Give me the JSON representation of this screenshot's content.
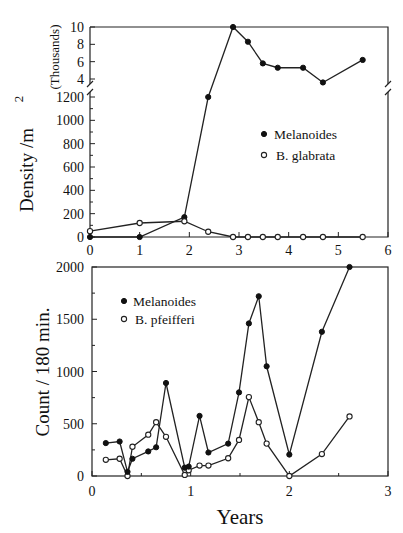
{
  "figure": {
    "title_partial": "",
    "shared_y_label": "Density /m",
    "shared_y_label_sup": "2",
    "x_label": "Years"
  },
  "chart_data": [
    {
      "type": "line",
      "panel": "top",
      "title": "",
      "xlabel": "",
      "ylabel": "Density /m2",
      "y_break": true,
      "upper_segment": {
        "label": "(Thousands)",
        "ylim": [
          3,
          10
        ],
        "ticks": [
          4,
          6,
          8,
          10
        ],
        "tick_labels": [
          "4",
          "6",
          "8",
          "10"
        ]
      },
      "lower_segment": {
        "ylim": [
          0,
          1200
        ],
        "ticks": [
          0,
          200,
          400,
          600,
          800,
          1000,
          1200
        ],
        "tick_labels": [
          "0",
          "200",
          "400",
          "600",
          "800",
          "1000",
          "1200"
        ]
      },
      "xlim": [
        0,
        6
      ],
      "xticks": [
        0,
        1,
        2,
        3,
        4,
        5,
        6
      ],
      "xtick_labels": [
        "0",
        "1",
        "2",
        "3",
        "4",
        "5",
        "6"
      ],
      "grid": false,
      "legend_position": "center-right",
      "legend": [
        {
          "name": "Melanoides",
          "marker": "filled-circle"
        },
        {
          "name": "B. glabrata",
          "marker": "open-circle"
        }
      ],
      "series": [
        {
          "name": "Melanoides",
          "marker": "filled",
          "x": [
            0,
            1,
            1.9,
            2.38,
            2.88,
            3.18,
            3.48,
            3.78,
            4.29,
            4.69,
            5.49
          ],
          "y": [
            0,
            0,
            170,
            1200,
            10000,
            8300,
            5800,
            5300,
            5300,
            3600,
            6200
          ]
        },
        {
          "name": "B. glabrata",
          "marker": "open",
          "x": [
            0,
            1,
            1.9,
            2.38,
            2.88,
            3.18,
            3.48,
            3.78,
            4.29,
            4.69,
            5.49
          ],
          "y": [
            50,
            120,
            135,
            45,
            0,
            0,
            0,
            0,
            0,
            0,
            0
          ]
        }
      ]
    },
    {
      "type": "line",
      "panel": "bottom",
      "title": "",
      "xlabel": "Years",
      "ylabel": "Count / 180 min.",
      "xlim": [
        0,
        3
      ],
      "ylim": [
        0,
        2000
      ],
      "xticks": [
        0,
        1,
        2,
        3
      ],
      "xtick_labels": [
        "0",
        "1",
        "2",
        "3"
      ],
      "yticks": [
        0,
        500,
        1000,
        1500,
        2000
      ],
      "ytick_labels": [
        "0",
        "500",
        "1000",
        "1500",
        "2000"
      ],
      "grid": false,
      "legend_position": "upper-left",
      "legend": [
        {
          "name": "Melanoides",
          "marker": "filled-circle"
        },
        {
          "name": "B. pfeifferi",
          "marker": "open-circle"
        }
      ],
      "series": [
        {
          "name": "Melanoides",
          "marker": "filled",
          "x": [
            0.14,
            0.28,
            0.36,
            0.41,
            0.57,
            0.65,
            0.75,
            0.94,
            0.98,
            1.09,
            1.18,
            1.38,
            1.49,
            1.59,
            1.69,
            1.77,
            2.0,
            2.33,
            2.61
          ],
          "y": [
            315,
            330,
            40,
            165,
            235,
            275,
            890,
            80,
            90,
            575,
            225,
            310,
            800,
            1460,
            1720,
            1050,
            205,
            1380,
            2000
          ]
        },
        {
          "name": "B. pfeifferi",
          "marker": "open",
          "x": [
            0.14,
            0.28,
            0.36,
            0.41,
            0.57,
            0.65,
            0.75,
            0.94,
            0.98,
            1.09,
            1.18,
            1.38,
            1.49,
            1.59,
            1.69,
            1.77,
            2.0,
            2.33,
            2.61
          ],
          "y": [
            155,
            165,
            0,
            280,
            395,
            515,
            375,
            10,
            55,
            100,
            100,
            170,
            345,
            755,
            515,
            310,
            0,
            210,
            570
          ]
        }
      ]
    }
  ]
}
